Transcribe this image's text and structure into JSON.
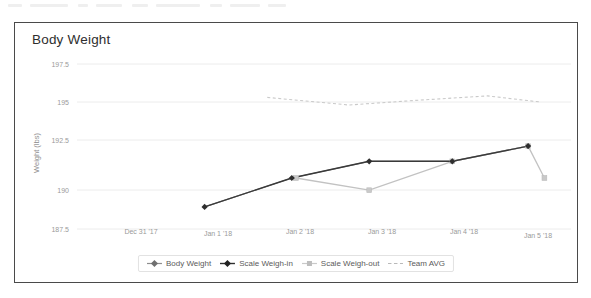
{
  "card": {
    "title": "Body Weight"
  },
  "axes": {
    "y_label": "Weight (lbs)",
    "y_ticks": [
      "197.5",
      "195",
      "192.5",
      "190",
      "187.5"
    ],
    "x_ticks": [
      "Dec 31 '17",
      "Jan 1 '18",
      "Jan 2 '18",
      "Jan 3 '18",
      "Jan 4 '18",
      "Jan 5 '18"
    ]
  },
  "legend": {
    "items": [
      {
        "label": "Body Weight",
        "marker": "diamond-line-marker",
        "color": "#7d7d7d"
      },
      {
        "label": "Scale Weigh-in",
        "marker": "diamond-line-marker",
        "color": "#2f2f2f"
      },
      {
        "label": "Scale Weigh-out",
        "marker": "square-line-marker",
        "color": "#c9c9c9"
      },
      {
        "label": "Team AVG",
        "marker": "dashed-line-marker",
        "color": "#c9c9c9"
      }
    ]
  },
  "chart_data": {
    "type": "line",
    "title": "Body Weight",
    "xlabel": "",
    "ylabel": "Weight (lbs)",
    "ylim": [
      187.5,
      198.1
    ],
    "yticks": [
      187.5,
      190,
      192.5,
      195,
      197.5
    ],
    "grid": true,
    "legend_position": "bottom",
    "x": [
      "Dec 31 '17",
      "Jan 1 '18",
      "Jan 2 '18",
      "Jan 3 '18",
      "Jan 4 '18",
      "Jan 5 '18"
    ],
    "series": [
      {
        "name": "Body Weight",
        "color": "#7d7d7d",
        "style": "solid",
        "marker": "diamond",
        "points": [
          {
            "x": 0.78,
            "y": 188.1
          },
          {
            "x": 1.85,
            "y": 190.0
          },
          {
            "x": 2.8,
            "y": 191.1
          },
          {
            "x": 3.82,
            "y": 191.1
          },
          {
            "x": 4.75,
            "y": 192.1
          }
        ]
      },
      {
        "name": "Scale Weigh-in",
        "color": "#2f2f2f",
        "style": "solid",
        "marker": "diamond",
        "points": [
          {
            "x": 0.78,
            "y": 188.1
          },
          {
            "x": 1.85,
            "y": 190.0
          },
          {
            "x": 2.8,
            "y": 191.1
          },
          {
            "x": 3.82,
            "y": 191.1
          },
          {
            "x": 4.75,
            "y": 192.1
          }
        ]
      },
      {
        "name": "Scale Weigh-out",
        "color": "#c9c9c9",
        "style": "solid",
        "marker": "square",
        "points": [
          {
            "x": 1.9,
            "y": 190.0
          },
          {
            "x": 2.8,
            "y": 189.2
          },
          {
            "x": 3.82,
            "y": 191.1
          },
          {
            "x": 4.75,
            "y": 192.1
          },
          {
            "x": 4.95,
            "y": 190.0
          }
        ]
      },
      {
        "name": "Team AVG",
        "color": "#c9c9c9",
        "style": "dashed",
        "marker": "none",
        "points": [
          {
            "x": 1.55,
            "y": 195.3
          },
          {
            "x": 2.55,
            "y": 194.8
          },
          {
            "x": 3.35,
            "y": 195.1
          },
          {
            "x": 4.25,
            "y": 195.4
          },
          {
            "x": 4.9,
            "y": 195.0
          }
        ]
      }
    ]
  }
}
